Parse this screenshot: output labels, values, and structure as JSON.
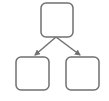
{
  "diagram": {
    "type": "hierarchy",
    "stroke_color": "#707070",
    "background_color": "#ffffff",
    "nodes": [
      {
        "id": "parent",
        "label": "",
        "x": 41,
        "y": 3,
        "width": 32,
        "height": 34,
        "radius": 5
      },
      {
        "id": "child-left",
        "label": "",
        "x": 16,
        "y": 57,
        "width": 33,
        "height": 33,
        "radius": 5
      },
      {
        "id": "child-right",
        "label": "",
        "x": 66,
        "y": 57,
        "width": 33,
        "height": 33,
        "radius": 5
      }
    ],
    "edges": [
      {
        "from": "parent",
        "to": "child-left",
        "x1": 56,
        "y1": 37,
        "x2": 35,
        "y2": 55,
        "arrow": true
      },
      {
        "from": "parent",
        "to": "child-right",
        "x1": 56,
        "y1": 37,
        "x2": 80,
        "y2": 55,
        "arrow": true
      }
    ]
  }
}
